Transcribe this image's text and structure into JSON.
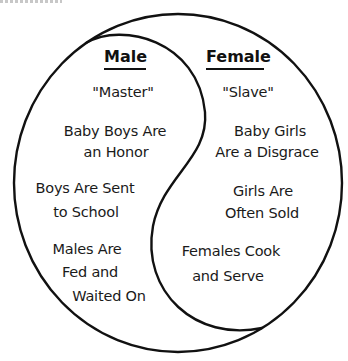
{
  "diagram": {
    "type": "yin-yang comparison",
    "colors": {
      "stroke": "#111111",
      "text": "#1a1a1a",
      "background": "#ffffff"
    },
    "left": {
      "heading": "Male",
      "items": [
        {
          "lines": [
            "\"Master\""
          ]
        },
        {
          "lines": [
            "Baby Boys Are",
            "an Honor"
          ]
        },
        {
          "lines": [
            "Boys Are Sent",
            "to School"
          ]
        },
        {
          "lines": [
            "Males Are",
            "Fed and",
            "Waited On"
          ]
        }
      ]
    },
    "right": {
      "heading": "Female",
      "items": [
        {
          "lines": [
            "\"Slave\""
          ]
        },
        {
          "lines": [
            "Baby Girls",
            "Are a Disgrace"
          ]
        },
        {
          "lines": [
            "Girls Are",
            "Often Sold"
          ]
        },
        {
          "lines": [
            "Females Cook",
            "and Serve"
          ]
        }
      ]
    }
  }
}
